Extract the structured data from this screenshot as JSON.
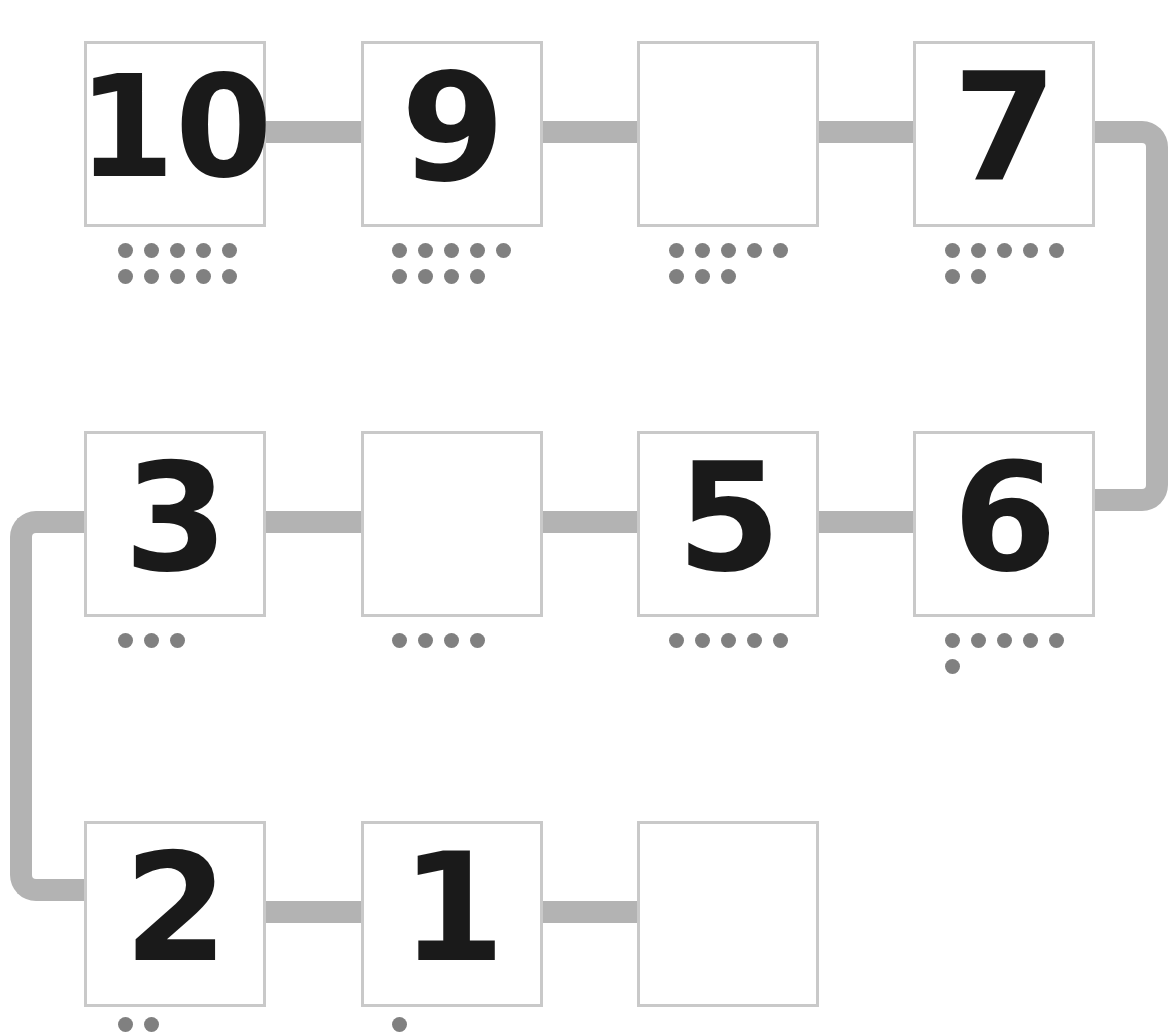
{
  "worksheet": {
    "title": "Number track 10 to 0",
    "track_color": "#b3b3b3",
    "card_border_color": "#c9c9c9",
    "dot_color": "#808080",
    "digit_color": "#1a1a1a",
    "background_color": "#ffffff"
  },
  "rows": [
    {
      "row_index": 1,
      "cells": [
        {
          "label": "10",
          "blank": false,
          "dot_count": 10
        },
        {
          "label": "9",
          "blank": false,
          "dot_count": 9
        },
        {
          "label": "",
          "blank": true,
          "dot_count": 8
        },
        {
          "label": "7",
          "blank": false,
          "dot_count": 7
        }
      ]
    },
    {
      "row_index": 2,
      "cells": [
        {
          "label": "3",
          "blank": false,
          "dot_count": 3
        },
        {
          "label": "",
          "blank": true,
          "dot_count": 4
        },
        {
          "label": "5",
          "blank": false,
          "dot_count": 5
        },
        {
          "label": "6",
          "blank": false,
          "dot_count": 6
        }
      ]
    },
    {
      "row_index": 3,
      "cells": [
        {
          "label": "2",
          "blank": false,
          "dot_count": 2
        },
        {
          "label": "1",
          "blank": false,
          "dot_count": 1
        },
        {
          "label": "",
          "blank": true,
          "dot_count": 0
        }
      ]
    }
  ],
  "chart_data": {
    "type": "table",
    "sequence": [
      10,
      9,
      8,
      7,
      6,
      5,
      4,
      3,
      2,
      1,
      0
    ],
    "rows": [
      {
        "labels": [
          "10",
          "9",
          "",
          "7"
        ],
        "dots": [
          10,
          9,
          8,
          7
        ]
      },
      {
        "labels": [
          "3",
          "",
          "5",
          "6"
        ],
        "dots": [
          3,
          4,
          5,
          6
        ]
      },
      {
        "labels": [
          "2",
          "1",
          ""
        ],
        "dots": [
          2,
          1,
          0
        ]
      }
    ],
    "blanks_expected": [
      "8",
      "4",
      "0"
    ],
    "connectors": [
      "row1-right-to-row2-right",
      "row2-left-to-row3-left"
    ]
  }
}
